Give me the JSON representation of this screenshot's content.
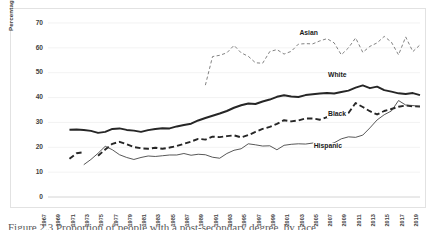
{
  "figure": {
    "caption": "Figure 2.3   Proportion of people with a post-secondary degree, by race"
  },
  "chart_data": {
    "type": "line",
    "title": "",
    "xlabel": "",
    "ylabel": "Percentage of relevant population",
    "ylim": [
      0,
      70
    ],
    "ytick_labels": [
      "0",
      "10",
      "20",
      "30",
      "40",
      "50",
      "60",
      "70"
    ],
    "yticks": [
      0,
      10,
      20,
      30,
      40,
      50,
      60,
      70
    ],
    "xlim": [
      1967,
      2019
    ],
    "grid": "horizontal",
    "legend_position": "inline-labels",
    "xtick_labels": [
      "1967",
      "1969",
      "1971",
      "1973",
      "1975",
      "1977",
      "1979",
      "1981",
      "1983",
      "1985",
      "1987",
      "1989",
      "1991",
      "1993",
      "1995",
      "1997",
      "1999",
      "2001",
      "2003",
      "2005",
      "2007",
      "2009",
      "2011",
      "2013",
      "2015",
      "2017",
      "2019"
    ],
    "x": [
      1967,
      1968,
      1969,
      1970,
      1971,
      1972,
      1973,
      1974,
      1975,
      1976,
      1977,
      1978,
      1979,
      1980,
      1981,
      1982,
      1983,
      1984,
      1985,
      1986,
      1987,
      1988,
      1989,
      1990,
      1991,
      1992,
      1993,
      1994,
      1995,
      1996,
      1997,
      1998,
      1999,
      2000,
      2001,
      2002,
      2003,
      2004,
      2005,
      2006,
      2007,
      2008,
      2009,
      2010,
      2011,
      2012,
      2013,
      2014,
      2015,
      2016,
      2017,
      2018,
      2019
    ],
    "series": [
      {
        "name": "White",
        "style": "thick-solid",
        "color": "#262626",
        "label_x": 2006,
        "label_y": 48.5,
        "values": [
          null,
          null,
          null,
          27.1,
          27.2,
          27.0,
          26.6,
          25.8,
          26.2,
          27.4,
          27.6,
          27.0,
          26.7,
          26.2,
          26.9,
          27.4,
          27.7,
          27.6,
          28.4,
          29.0,
          29.5,
          30.8,
          31.8,
          32.7,
          33.6,
          34.6,
          35.9,
          36.9,
          37.6,
          37.4,
          38.4,
          39.2,
          40.3,
          40.9,
          40.4,
          40.2,
          41.0,
          41.3,
          41.6,
          41.8,
          41.6,
          42.2,
          42.8,
          44.0,
          44.9,
          43.8,
          44.4,
          43.0,
          42.4,
          41.7,
          41.4,
          41.8,
          41.0
        ]
      },
      {
        "name": "Black",
        "style": "thick-dashed",
        "color": "#262626",
        "label_x": 2006,
        "label_y": 33.0,
        "values": [
          null,
          null,
          null,
          15.4,
          17.6,
          18.0,
          null,
          16.6,
          19.1,
          21.4,
          22.2,
          21.2,
          20.1,
          19.6,
          19.4,
          19.8,
          19.4,
          19.9,
          20.5,
          21.4,
          22.3,
          23.4,
          23.1,
          24.3,
          24.1,
          24.5,
          24.8,
          24.0,
          24.9,
          26.2,
          27.4,
          28.2,
          29.4,
          30.9,
          30.4,
          30.8,
          31.6,
          31.6,
          31.1,
          32.1,
          32.2,
          32.5,
          33.8,
          37.8,
          36.2,
          34.5,
          33.2,
          34.6,
          35.4,
          36.3,
          36.8,
          36.5,
          36.4
        ]
      },
      {
        "name": "Hispanic",
        "style": "thin-solid",
        "color": "#3a3a3a",
        "label_x": 2004,
        "label_y": 20.0,
        "values": [
          null,
          null,
          null,
          null,
          null,
          13.0,
          15.1,
          17.6,
          20.4,
          19.0,
          17.0,
          15.9,
          15.1,
          15.9,
          16.5,
          16.3,
          16.6,
          16.9,
          16.9,
          17.5,
          16.8,
          17.2,
          17.0,
          16.0,
          15.6,
          17.5,
          18.8,
          19.4,
          21.4,
          21.0,
          20.5,
          20.6,
          19.0,
          20.8,
          21.2,
          21.4,
          21.3,
          21.7,
          20.6,
          21.0,
          21.8,
          23.4,
          24.2,
          24.0,
          24.9,
          27.8,
          31.0,
          33.1,
          34.6,
          38.8,
          37.0,
          36.8,
          36.4
        ]
      },
      {
        "name": "Asian",
        "style": "thin-dashed",
        "color": "#6b6b6b",
        "label_x": 2002,
        "label_y": 65.5,
        "values": [
          null,
          null,
          null,
          null,
          null,
          null,
          null,
          null,
          null,
          null,
          null,
          null,
          null,
          null,
          null,
          null,
          null,
          null,
          null,
          null,
          null,
          null,
          45.0,
          56.5,
          57.0,
          58.0,
          61.0,
          58.0,
          56.6,
          54.0,
          53.8,
          58.5,
          59.3,
          57.5,
          58.6,
          61.5,
          61.7,
          61.6,
          62.8,
          63.7,
          62.0,
          57.2,
          60.0,
          64.0,
          58.2,
          60.6,
          62.0,
          64.6,
          62.3,
          57.2,
          64.4,
          58.5,
          61.2
        ]
      }
    ]
  }
}
